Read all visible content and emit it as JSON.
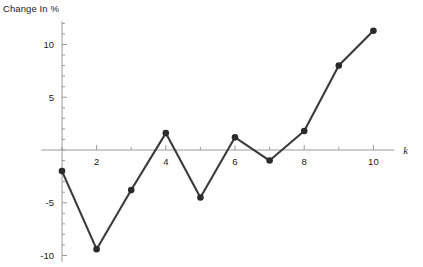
{
  "chart_data": {
    "type": "line",
    "title": "Change In %",
    "xlabel": "k",
    "ylabel": "",
    "x": [
      1,
      2,
      3,
      4,
      5,
      6,
      7,
      8,
      9,
      10
    ],
    "values": [
      -2.0,
      -9.4,
      -3.8,
      1.6,
      -4.5,
      1.2,
      -1.0,
      1.8,
      8.0,
      11.3
    ],
    "series": [
      {
        "name": "Change In %",
        "values": [
          -2.0,
          -9.4,
          -3.8,
          1.6,
          -4.5,
          1.2,
          -1.0,
          1.8,
          8.0,
          11.3
        ]
      }
    ],
    "xlim": [
      0.4,
      10.6
    ],
    "ylim": [
      -10.6,
      12.2
    ],
    "xticks": [
      2,
      4,
      6,
      8,
      10
    ],
    "xtick_labels": [
      "2",
      "4",
      "6",
      "8",
      "10"
    ],
    "yticks": [
      -10,
      -5,
      5,
      10
    ],
    "ytick_labels": [
      "-10",
      "-5",
      "5",
      "10"
    ],
    "minor_tick_step": 1,
    "grid": false,
    "legend": false,
    "marker": "filled-circle",
    "line_color": "#3a3a3a",
    "marker_color": "#2b2b2b",
    "axis_color": "#9a9a9a",
    "text_color": "#1a1a1a"
  },
  "axes": {
    "y_axis_name": "y-axis",
    "x_axis_name": "x-axis"
  }
}
